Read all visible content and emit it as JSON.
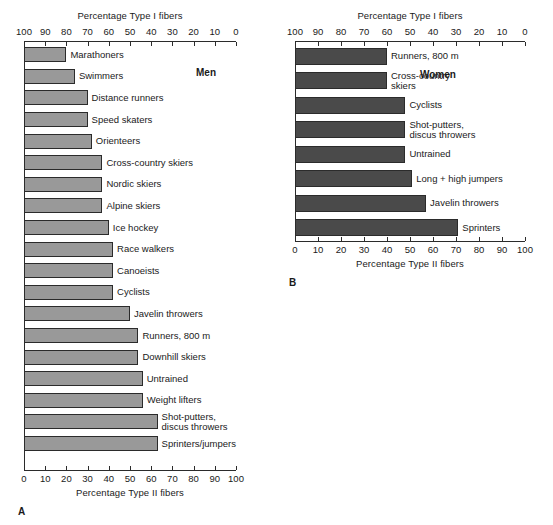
{
  "chart_data": [
    {
      "type": "bar",
      "panel": "A",
      "title": "Men",
      "orientation": "horizontal",
      "top_axis_label": "Percentage Type I fibers",
      "bottom_axis_label": "Percentage Type II fibers",
      "top_ticks": [
        100,
        90,
        80,
        70,
        60,
        50,
        40,
        30,
        20,
        10,
        0
      ],
      "bottom_ticks": [
        0,
        10,
        20,
        30,
        40,
        50,
        60,
        70,
        80,
        90,
        100
      ],
      "xlim": [
        0,
        100
      ],
      "ylabel": "",
      "xlabel": "Percentage Type II fibers",
      "grid": false,
      "legend": "none",
      "bar_color": "#999999",
      "categories": [
        "Marathoners",
        "Swimmers",
        "Distance runners",
        "Speed skaters",
        "Orienteers",
        "Cross-country skiers",
        "Nordic skiers",
        "Alpine skiers",
        "Ice hockey",
        "Race walkers",
        "Canoeists",
        "Cyclists",
        "Javelin throwers",
        "Runners, 800 m",
        "Downhill skiers",
        "Untrained",
        "Weight lifters",
        "Shot-putters, discus throwers",
        "Sprinters/jumpers"
      ],
      "values": [
        20,
        24,
        30,
        30,
        32,
        37,
        37,
        37,
        40,
        42,
        42,
        42,
        50,
        54,
        54,
        56,
        56,
        63,
        63
      ]
    },
    {
      "type": "bar",
      "panel": "B",
      "title": "Women",
      "orientation": "horizontal",
      "top_axis_label": "Percentage Type I fibers",
      "bottom_axis_label": "Percentage Type II fibers",
      "top_ticks": [
        100,
        90,
        80,
        70,
        60,
        50,
        40,
        30,
        20,
        10,
        0
      ],
      "bottom_ticks": [
        0,
        10,
        20,
        30,
        40,
        50,
        60,
        70,
        80,
        90,
        100
      ],
      "xlim": [
        0,
        100
      ],
      "ylabel": "",
      "xlabel": "Percentage Type II fibers",
      "grid": false,
      "legend": "none",
      "bar_color": "#4a4a4a",
      "categories": [
        "Runners, 800 m",
        "Cross-country skiers",
        "Cyclists",
        "Shot-putters, discus throwers",
        "Untrained",
        "Long + high jumpers",
        "Javelin throwers",
        "Sprinters"
      ],
      "values": [
        40,
        40,
        48,
        48,
        48,
        51,
        57,
        71
      ]
    }
  ],
  "panel_a": {
    "letter": "A",
    "group_title": "Men",
    "top_axis_label": "Percentage Type I fibers",
    "bottom_axis_label": "Percentage Type II fibers",
    "top_ticks": [
      "100",
      "90",
      "80",
      "70",
      "60",
      "50",
      "40",
      "30",
      "20",
      "10",
      "0"
    ],
    "bottom_ticks": [
      "0",
      "10",
      "20",
      "30",
      "40",
      "50",
      "60",
      "70",
      "80",
      "90",
      "100"
    ],
    "rows": [
      {
        "label": "Marathoners",
        "label2": "",
        "value": 20
      },
      {
        "label": "Swimmers",
        "label2": "",
        "value": 24
      },
      {
        "label": "Distance runners",
        "label2": "",
        "value": 30
      },
      {
        "label": "Speed skaters",
        "label2": "",
        "value": 30
      },
      {
        "label": "Orienteers",
        "label2": "",
        "value": 32
      },
      {
        "label": "Cross-country skiers",
        "label2": "",
        "value": 37
      },
      {
        "label": "Nordic skiers",
        "label2": "",
        "value": 37
      },
      {
        "label": "Alpine skiers",
        "label2": "",
        "value": 37
      },
      {
        "label": "Ice hockey",
        "label2": "",
        "value": 40
      },
      {
        "label": "Race walkers",
        "label2": "",
        "value": 42
      },
      {
        "label": "Canoeists",
        "label2": "",
        "value": 42
      },
      {
        "label": "Cyclists",
        "label2": "",
        "value": 42
      },
      {
        "label": "Javelin throwers",
        "label2": "",
        "value": 50
      },
      {
        "label": "Runners, 800 m",
        "label2": "",
        "value": 54
      },
      {
        "label": "Downhill skiers",
        "label2": "",
        "value": 54
      },
      {
        "label": "Untrained",
        "label2": "",
        "value": 56
      },
      {
        "label": "Weight lifters",
        "label2": "",
        "value": 56
      },
      {
        "label": "Shot-putters,",
        "label2": "discus throwers",
        "value": 63
      },
      {
        "label": "Sprinters/jumpers",
        "label2": "",
        "value": 63
      }
    ]
  },
  "panel_b": {
    "letter": "B",
    "group_title": "Women",
    "top_axis_label": "Percentage Type I fibers",
    "bottom_axis_label": "Percentage Type II fibers",
    "top_ticks": [
      "100",
      "90",
      "80",
      "70",
      "60",
      "50",
      "40",
      "30",
      "20",
      "10",
      "0"
    ],
    "bottom_ticks": [
      "0",
      "10",
      "20",
      "30",
      "40",
      "50",
      "60",
      "70",
      "80",
      "90",
      "100"
    ],
    "rows": [
      {
        "label": "Runners, 800 m",
        "label2": "",
        "value": 40
      },
      {
        "label": "Cross-country",
        "label2": "skiers",
        "value": 40
      },
      {
        "label": "Cyclists",
        "label2": "",
        "value": 48
      },
      {
        "label": "Shot-putters,",
        "label2": "discus throwers",
        "value": 48
      },
      {
        "label": "Untrained",
        "label2": "",
        "value": 48
      },
      {
        "label": "Long + high jumpers",
        "label2": "",
        "value": 51
      },
      {
        "label": "Javelin throwers",
        "label2": "",
        "value": 57
      },
      {
        "label": "Sprinters",
        "label2": "",
        "value": 71
      }
    ]
  },
  "colors": {
    "bar_a": "#999999",
    "bar_b": "#4a4a4a",
    "axis": "#2b2b2b",
    "text": "#1a1a1a",
    "background": "#ffffff"
  }
}
